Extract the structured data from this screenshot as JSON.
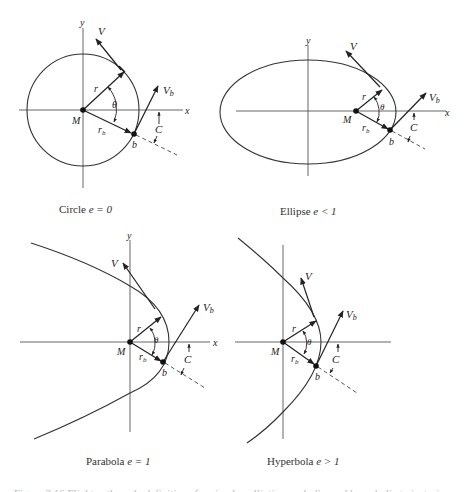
{
  "figure": {
    "panels": [
      {
        "id": "circle",
        "caption_name": "Circle",
        "caption_eccentricity": "e = 0",
        "labels": {
          "y": "y",
          "x": "x",
          "V": "V",
          "Vb": "V",
          "Vb_sub": "b",
          "r": "r",
          "theta": "θ",
          "M": "M",
          "rb": "r",
          "rb_sub": "b",
          "b": "b",
          "C": "C"
        }
      },
      {
        "id": "ellipse",
        "caption_name": "Ellipse",
        "caption_eccentricity": "e < 1",
        "labels": {
          "y": "y",
          "x": "x",
          "V": "V",
          "Vb": "V",
          "Vb_sub": "b",
          "r": "r",
          "theta": "θ",
          "M": "M",
          "rb": "r",
          "rb_sub": "b",
          "b": "b",
          "C": "C"
        }
      },
      {
        "id": "parabola",
        "caption_name": "Parabola",
        "caption_eccentricity": "e = 1",
        "labels": {
          "y": "y",
          "x": "x",
          "V": "V",
          "Vb": "V",
          "Vb_sub": "b",
          "r": "r",
          "theta": "θ",
          "M": "M",
          "rb": "r",
          "rb_sub": "b",
          "b": "b",
          "C": "C"
        }
      },
      {
        "id": "hyperbola",
        "caption_name": "Hyperbola",
        "caption_eccentricity": "e > 1",
        "labels": {
          "V": "V",
          "Vb": "V",
          "Vb_sub": "b",
          "r": "r",
          "theta": "θ",
          "M": "M",
          "rb": "r",
          "rb_sub": "b",
          "b": "b",
          "C": "C"
        }
      }
    ],
    "caption_partial": "Figure 2.16   Flight path angle definitions for circular, elliptic, parabolic, and hyperbolic trajectories."
  }
}
